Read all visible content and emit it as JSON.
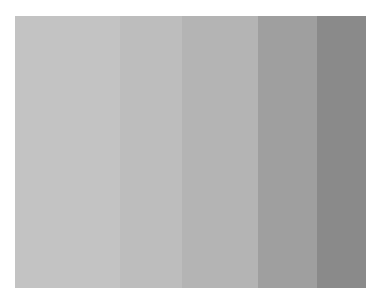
{
  "image": {
    "description": "Grayscale step wedge with five vertical bands, light to dark",
    "bands": [
      {
        "width": 105,
        "color": "#c3c3c3"
      },
      {
        "width": 62,
        "color": "#bdbdbd"
      },
      {
        "width": 76,
        "color": "#b4b4b4"
      },
      {
        "width": 59,
        "color": "#9f9f9f"
      },
      {
        "width": 49,
        "color": "#8a8a8a"
      }
    ]
  }
}
